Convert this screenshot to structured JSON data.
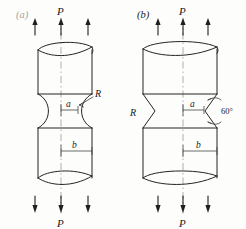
{
  "figure": {
    "kind": "engineering-line-drawing",
    "background_color": "#fdfdfb",
    "ink_color": "#242424",
    "centerline_color": "#9a9a9a"
  },
  "panels": [
    {
      "id": "a",
      "label": "(a)",
      "notch_type": "semicircular-groove",
      "labels": {
        "force_top": "P",
        "force_bottom": "P",
        "minor_dimension": "a",
        "major_dimension": "b",
        "radius": "R"
      }
    },
    {
      "id": "b",
      "label": "(b)",
      "notch_type": "vee-groove",
      "labels": {
        "force_top": "P",
        "force_bottom": "P",
        "minor_dimension": "a",
        "major_dimension": "b",
        "radius": "R",
        "included_angle": "60°"
      }
    }
  ],
  "symbols": {
    "force": "P",
    "radius": "R",
    "angle": "60°",
    "throat_diameter": "a",
    "bar_diameter": "b"
  }
}
